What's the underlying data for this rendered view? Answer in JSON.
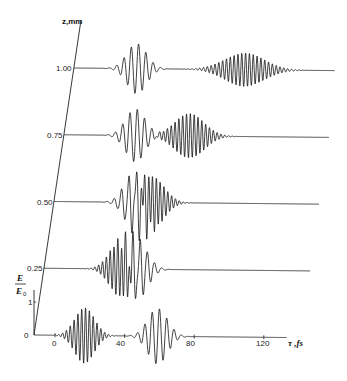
{
  "chart_data": {
    "type": "line",
    "title": "",
    "subtitle": "Evolution of two wave packets E/E0 along propagation distance z",
    "xlabel": "τ ,fs",
    "ylabel": "z,mm",
    "amplitude_label": {
      "num": "E",
      "den": "E0",
      "tick": "1",
      "zero": "0"
    },
    "x_ticks": [
      0,
      40,
      80,
      120
    ],
    "x_tick_labels": [
      "0",
      "40",
      "80",
      "120"
    ],
    "xlim": [
      -12,
      134
    ],
    "z_ticks": [
      0,
      0.25,
      0.5,
      0.75,
      1.0
    ],
    "z_tick_labels": [
      "0",
      "0.25",
      "0.50",
      "0.75",
      "1.00"
    ],
    "grid": false,
    "legend": null,
    "series": [
      {
        "name": "z=0",
        "z": 0.0,
        "packets": [
          {
            "kind": "high-freq",
            "center_fs": 17,
            "width_fs": 8,
            "amp": 1.0,
            "period_fs": 2.2
          },
          {
            "kind": "low-freq",
            "center_fs": 59,
            "width_fs": 8,
            "amp": 1.0,
            "period_fs": 4.2
          }
        ]
      },
      {
        "name": "z=0.25",
        "z": 0.25,
        "packets": [
          {
            "kind": "high-freq",
            "center_fs": 32,
            "width_fs": 9,
            "amp": 1.0,
            "period_fs": 2.2
          },
          {
            "kind": "low-freq",
            "center_fs": 42,
            "width_fs": 8,
            "amp": 1.0,
            "period_fs": 4.2
          }
        ]
      },
      {
        "name": "z=0.50",
        "z": 0.5,
        "packets": [
          {
            "kind": "low-freq",
            "center_fs": 34,
            "width_fs": 8,
            "amp": 1.0,
            "period_fs": 4.2
          },
          {
            "kind": "high-freq",
            "center_fs": 44,
            "width_fs": 10,
            "amp": 0.95,
            "period_fs": 2.2
          }
        ]
      },
      {
        "name": "z=0.75",
        "z": 0.75,
        "packets": [
          {
            "kind": "low-freq",
            "center_fs": 29,
            "width_fs": 8,
            "amp": 0.95,
            "period_fs": 4.2
          },
          {
            "kind": "high-freq",
            "center_fs": 60,
            "width_fs": 12,
            "amp": 0.8,
            "period_fs": 2.2
          }
        ]
      },
      {
        "name": "z=1.00",
        "z": 1.0,
        "packets": [
          {
            "kind": "low-freq",
            "center_fs": 24,
            "width_fs": 8,
            "amp": 0.9,
            "period_fs": 4.2
          },
          {
            "kind": "high-freq",
            "center_fs": 86,
            "width_fs": 16,
            "amp": 0.6,
            "period_fs": 2.2
          }
        ]
      }
    ]
  },
  "labels": {
    "z_axis": "z,mm",
    "tau_axis": "τ ,fs",
    "e_num": "E",
    "e_den": "E",
    "e_den_sub": "0",
    "e_tick_1": "1",
    "zero": "0",
    "z_ticks": [
      "0.25",
      "0.50",
      "0.75",
      "1.00"
    ],
    "tau_ticks": [
      "0",
      "40",
      "80",
      "120"
    ]
  }
}
